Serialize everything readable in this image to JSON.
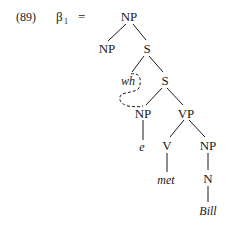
{
  "example_number": "(89)",
  "lhs": {
    "symbol": "β",
    "subscript": "1",
    "equals": "="
  },
  "tree": {
    "nodes": [
      {
        "id": "np_root",
        "label": "NP",
        "italic": false
      },
      {
        "id": "np_left",
        "label": "NP",
        "italic": false
      },
      {
        "id": "s_outer",
        "label": "S",
        "italic": false
      },
      {
        "id": "wh",
        "label": "wh",
        "italic": true
      },
      {
        "id": "s_inner",
        "label": "S",
        "italic": false
      },
      {
        "id": "np_subj",
        "label": "NP",
        "italic": false
      },
      {
        "id": "vp",
        "label": "VP",
        "italic": false
      },
      {
        "id": "e",
        "label": "e",
        "italic": true
      },
      {
        "id": "v",
        "label": "V",
        "italic": false
      },
      {
        "id": "np_obj",
        "label": "NP",
        "italic": false
      },
      {
        "id": "met",
        "label": "met",
        "italic": true
      },
      {
        "id": "n",
        "label": "N",
        "italic": false
      },
      {
        "id": "bill",
        "label": "Bill",
        "italic": true
      }
    ],
    "edges": [
      [
        "np_root",
        "np_left"
      ],
      [
        "np_root",
        "s_outer"
      ],
      [
        "s_outer",
        "wh"
      ],
      [
        "s_outer",
        "s_inner"
      ],
      [
        "s_inner",
        "np_subj"
      ],
      [
        "s_inner",
        "vp"
      ],
      [
        "np_subj",
        "e"
      ],
      [
        "vp",
        "v"
      ],
      [
        "vp",
        "np_obj"
      ],
      [
        "v",
        "met"
      ],
      [
        "np_obj",
        "n"
      ],
      [
        "n",
        "bill"
      ]
    ],
    "coindexation": {
      "from": "wh",
      "to": "np_subj",
      "style": "dashed"
    }
  }
}
